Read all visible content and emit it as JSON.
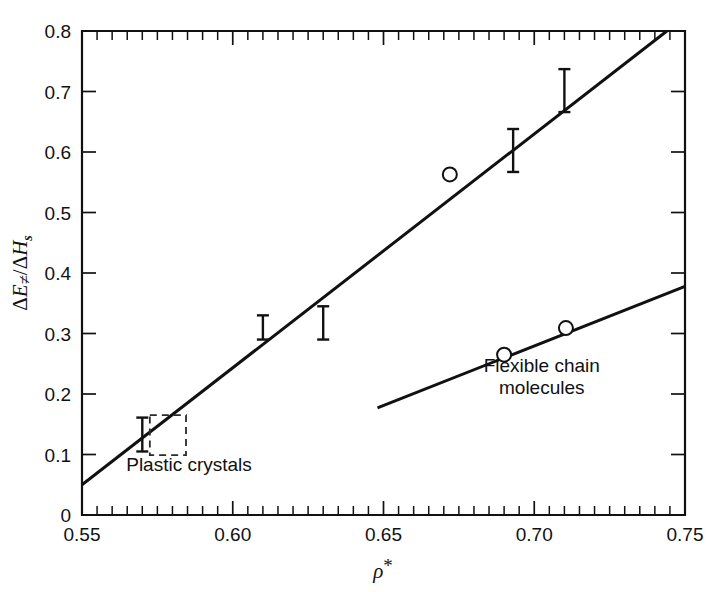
{
  "figure": {
    "background": "#ffffff",
    "ink_color": "#111111"
  },
  "axis_titles": {
    "x": "ρ*",
    "y": "ΔE≠/ΔHs",
    "y_parts": {
      "num_delta": "Δ",
      "num_var": "E",
      "num_sup": "≠",
      "slash": "/",
      "den_delta": "Δ",
      "den_var": "H",
      "den_sub": "s"
    },
    "x_parts": {
      "rho": "ρ",
      "star": "*"
    }
  },
  "annotations": [
    {
      "id": "plastic-crystals",
      "text": "Plastic crystals",
      "x_data": 0.5855,
      "y_data": 0.073
    },
    {
      "id": "flexible-chain-1",
      "text": "Flexible chain",
      "x_data": 0.7025,
      "y_data": 0.2365
    },
    {
      "id": "flexible-chain-2",
      "text": "molecules",
      "x_data": 0.7025,
      "y_data": 0.2005
    }
  ],
  "chart_data": {
    "type": "scatter",
    "title": "",
    "xlabel": "ρ*",
    "ylabel": "ΔE≠/ΔHs",
    "xlim": [
      0.55,
      0.75
    ],
    "ylim": [
      0.0,
      0.8
    ],
    "grid": false,
    "legend_position": "none",
    "x_ticks_major": [
      0.55,
      0.6,
      0.65,
      0.7,
      0.75
    ],
    "x_tick_labels": [
      "0.55",
      "0.60",
      "0.65",
      "0.70",
      "0.75"
    ],
    "x_tick_minor_step": 0.005,
    "y_ticks_major": [
      0.0,
      0.1,
      0.2,
      0.3,
      0.4,
      0.5,
      0.6,
      0.7,
      0.8
    ],
    "y_tick_labels": [
      "0",
      "0.1",
      "0.2",
      "0.3",
      "0.4",
      "0.5",
      "0.6",
      "0.7",
      "0.8"
    ],
    "series": [
      {
        "name": "Plastic crystals (error bars)",
        "marker": "error-bar",
        "points": [
          {
            "x": 0.57,
            "y": 0.132,
            "yerr_low": 0.105,
            "yerr_high": 0.161
          },
          {
            "x": 0.61,
            "y": 0.322,
            "yerr_low": 0.29,
            "yerr_high": 0.33
          },
          {
            "x": 0.63,
            "y": 0.352,
            "yerr_low": 0.29,
            "yerr_high": 0.345
          },
          {
            "x": 0.693,
            "y": 0.605,
            "yerr_low": 0.567,
            "yerr_high": 0.638
          },
          {
            "x": 0.71,
            "y": 0.707,
            "yerr_low": 0.666,
            "yerr_high": 0.737
          }
        ]
      },
      {
        "name": "Open circle observations",
        "marker": "open-circle",
        "points": [
          {
            "x": 0.672,
            "y": 0.563
          },
          {
            "x": 0.69,
            "y": 0.265
          },
          {
            "x": 0.7105,
            "y": 0.309
          }
        ]
      },
      {
        "name": "Plastic crystals trend line",
        "marker": "line",
        "points": [
          {
            "x": 0.55,
            "y": 0.05
          },
          {
            "x": 0.744,
            "y": 0.8
          }
        ]
      },
      {
        "name": "Flexible chain molecules trend line",
        "marker": "line",
        "points": [
          {
            "x": 0.648,
            "y": 0.177
          },
          {
            "x": 0.75,
            "y": 0.378
          }
        ]
      }
    ],
    "shapes": [
      {
        "id": "plastic-crystal-region",
        "type": "dashed-rect",
        "x0": 0.5725,
        "x1": 0.5845,
        "y0": 0.099,
        "y1": 0.165
      }
    ]
  }
}
